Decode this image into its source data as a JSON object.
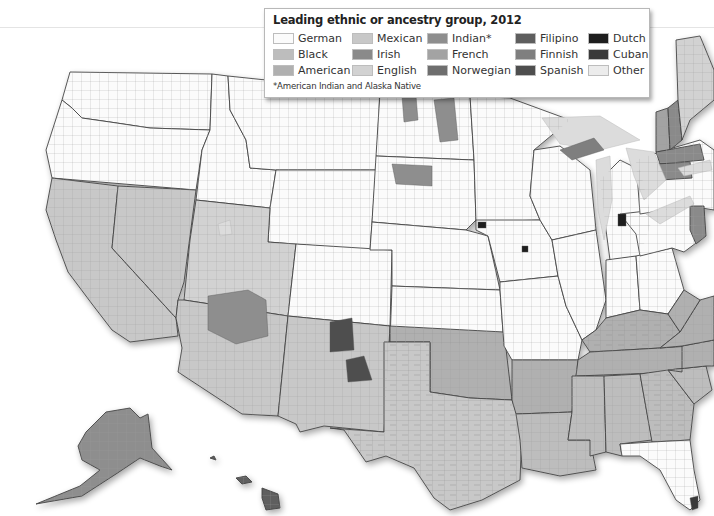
{
  "legend": {
    "title": "Leading ethnic or ancestry group, 2012",
    "note": "*American Indian and Alaska Native",
    "items": [
      {
        "label": "German",
        "color": "#fbfbfb"
      },
      {
        "label": "Mexican",
        "color": "#c8c8c8"
      },
      {
        "label": "Indian*",
        "color": "#8e8e8e"
      },
      {
        "label": "Filipino",
        "color": "#5e5e5e"
      },
      {
        "label": "Dutch",
        "color": "#1e1e1e"
      },
      {
        "label": "Black",
        "color": "#bdbdbd"
      },
      {
        "label": "Irish",
        "color": "#8a8a8a"
      },
      {
        "label": "French",
        "color": "#a3a3a3"
      },
      {
        "label": "Finnish",
        "color": "#7f7f7f"
      },
      {
        "label": "Cuban",
        "color": "#3a3a3a"
      },
      {
        "label": "American",
        "color": "#b0b0b0"
      },
      {
        "label": "English",
        "color": "#d2d2d2"
      },
      {
        "label": "Norwegian",
        "color": "#6e6e6e"
      },
      {
        "label": "Spanish",
        "color": "#4e4e4e"
      },
      {
        "label": "Other",
        "color": "#ececec"
      }
    ]
  },
  "regions": {
    "washington": "German",
    "oregon": "German",
    "california": "Mexican",
    "nevada": "Mexican",
    "idaho": "German",
    "montana": "German",
    "wyoming": "German",
    "utah": "English",
    "arizona": "Mexican",
    "new_mexico": "Mexican",
    "colorado": "German",
    "north_dakota": "German",
    "south_dakota": "German",
    "nebraska": "German",
    "kansas": "German",
    "oklahoma": "American",
    "texas": "Mexican",
    "minnesota": "German",
    "iowa": "German",
    "missouri": "German",
    "arkansas": "American",
    "louisiana": "Black",
    "wisconsin": "German",
    "illinois": "German",
    "michigan": "German",
    "indiana": "German",
    "ohio": "German",
    "kentucky": "American",
    "tennessee": "American",
    "mississippi": "Black",
    "alabama": "Black",
    "georgia": "Black",
    "florida": "German",
    "south_carolina": "Black",
    "north_carolina": "American",
    "virginia": "American",
    "west_virginia": "American",
    "pennsylvania": "German",
    "new_york": "German",
    "vermont": "French",
    "new_hampshire": "Irish",
    "maine": "English",
    "massachusetts": "Irish",
    "connecticut": "Irish",
    "new_jersey": "Irish",
    "alaska": "Indian*",
    "hawaii": "Filipino"
  },
  "highlights": [
    {
      "area": "navajo_nation",
      "group": "Indian*"
    },
    {
      "area": "northern_new_mexico",
      "group": "Spanish"
    },
    {
      "area": "dakota_reservations",
      "group": "Indian*"
    },
    {
      "area": "upper_peninsula",
      "group": "Finnish"
    },
    {
      "area": "south_florida",
      "group": "Cuban"
    },
    {
      "area": "ottawa_county_michigan",
      "group": "Dutch"
    },
    {
      "area": "sioux_county_iowa",
      "group": "Dutch"
    },
    {
      "area": "marion_county_iowa",
      "group": "Dutch"
    }
  ]
}
